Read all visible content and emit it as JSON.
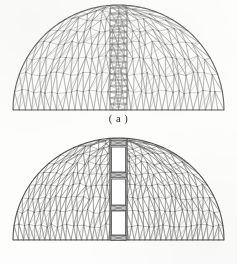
{
  "figure": {
    "background_color": "#fdfdfc",
    "panels": [
      {
        "id": "a",
        "caption": "( a )",
        "description": "coarse triangular finite element mesh of semicircular dome with central ladder column",
        "mesh_color": "#8e8e8e",
        "outline_color": "#5a5a5a",
        "node_color": "#6d6d6d",
        "line_width": 0.45,
        "dome": {
          "left_x": 13,
          "right_x": 224,
          "baseline_y": 110,
          "apex_y": 5,
          "radius_x": 105.5,
          "radius_y": 105
        },
        "mesh": {
          "ring_count": 9,
          "sector_count": 34,
          "triangle_style": "unstructured-delaunay",
          "node_count_estimate": 430
        },
        "central_column": {
          "x_left": 110,
          "x_right": 127,
          "top_y": 8,
          "bottom_y": 110,
          "type": "ladder-lattice",
          "cell_count": 17,
          "fill": "none"
        }
      },
      {
        "id": "b",
        "caption": "( b )",
        "description": "refined dense triangular finite element mesh of semicircular dome with central column containing four rectangular voids",
        "mesh_color": "#7a7a7a",
        "outline_color": "#4a4a4a",
        "node_color": "#5c5c5c",
        "line_width": 0.5,
        "dome": {
          "left_x": 13,
          "right_x": 224,
          "baseline_y": 240,
          "apex_y": 138,
          "radius_x": 105.5,
          "radius_y": 102
        },
        "mesh": {
          "ring_count": 11,
          "sector_count": 40,
          "triangle_style": "unstructured-delaunay-refined",
          "node_count_estimate": 610
        },
        "central_column": {
          "x_left": 110,
          "x_right": 127,
          "top_y": 139,
          "bottom_y": 240,
          "type": "slotted-voids",
          "void_fill": "#ffffff",
          "voids": [
            {
              "top_y": 147,
              "bottom_y": 172
            },
            {
              "top_y": 179,
              "bottom_y": 205
            },
            {
              "top_y": 211,
              "bottom_y": 235
            }
          ],
          "connector_blocks": [
            {
              "center_y": 143
            },
            {
              "center_y": 175
            },
            {
              "center_y": 208
            },
            {
              "center_y": 238
            }
          ]
        }
      }
    ]
  }
}
